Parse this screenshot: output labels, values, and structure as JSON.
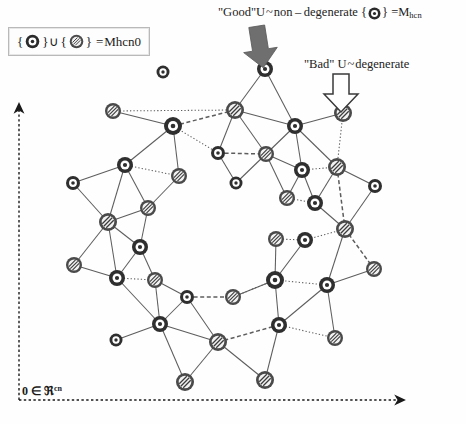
{
  "figure": {
    "title_good": {
      "prefix": "\"Good\"",
      "u": "U",
      "relation": "~",
      "kind": "non – degenerate",
      "set_open": "{",
      "set_close": "}",
      "equals": "=",
      "manifold": "M",
      "manifold_sub": "hcn"
    },
    "title_bad": {
      "prefix": "\"Bad\"",
      "u": "U",
      "relation": "~",
      "kind": "degenerate"
    },
    "legend": {
      "set_open": "{",
      "set_close": "}",
      "union": "∪",
      "equals": "=",
      "manifold": "M",
      "manifold_sub": "hcn",
      "manifold_sub2": "0"
    },
    "axis": {
      "origin": "0",
      "member": "∈",
      "space": "ℜ",
      "exponent": "cn"
    },
    "colors": {
      "node_good_ring": "#2f2f2f",
      "node_good_core": "#ffffff",
      "node_bad_ring": "#4a4a4a",
      "node_bad_fill": "#f2f2f2",
      "edge": "#5d5d5d",
      "arrow_solid": "#6f6f6f",
      "arrow_hollow_fill": "#ffffff",
      "arrow_hollow_stroke": "#3a3a3a",
      "axis": "#1a1a1a",
      "background": "#ffffff"
    },
    "node_types": {
      "good": "non-degenerate",
      "bad": "degenerate"
    },
    "arrows": {
      "solid_arrow": "solid-down-arrow-good",
      "hollow_arrow": "hollow-down-arrow-bad"
    },
    "axes": {
      "vertical": "dotted-vertical-axis-arrow",
      "horizontal": "dotted-horizontal-axis-arrow"
    }
  },
  "chart_data": {
    "type": "scatter",
    "nodes": [
      {
        "id": "iso1",
        "x": 163,
        "y": 72,
        "type": "good",
        "r": 6.5
      },
      {
        "id": "n1",
        "x": 265,
        "y": 69,
        "type": "good",
        "r": 8
      },
      {
        "id": "n2",
        "x": 113,
        "y": 111,
        "type": "bad",
        "r": 8
      },
      {
        "id": "n3",
        "x": 235,
        "y": 110,
        "type": "bad",
        "r": 9
      },
      {
        "id": "n4",
        "x": 343,
        "y": 113,
        "type": "bad",
        "r": 9
      },
      {
        "id": "n5",
        "x": 173,
        "y": 126,
        "type": "good",
        "r": 9
      },
      {
        "id": "n6",
        "x": 295,
        "y": 126,
        "type": "good",
        "r": 8
      },
      {
        "id": "n7",
        "x": 125,
        "y": 165,
        "type": "good",
        "r": 8
      },
      {
        "id": "n8",
        "x": 218,
        "y": 153,
        "type": "good",
        "r": 7
      },
      {
        "id": "n9",
        "x": 266,
        "y": 154,
        "type": "bad",
        "r": 8
      },
      {
        "id": "n10",
        "x": 179,
        "y": 176,
        "type": "bad",
        "r": 8
      },
      {
        "id": "n11",
        "x": 302,
        "y": 170,
        "type": "good",
        "r": 8
      },
      {
        "id": "n12",
        "x": 337,
        "y": 167,
        "type": "bad",
        "r": 9
      },
      {
        "id": "n13",
        "x": 73,
        "y": 183,
        "type": "good",
        "r": 7
      },
      {
        "id": "n14",
        "x": 236,
        "y": 183,
        "type": "good",
        "r": 6.5
      },
      {
        "id": "n15",
        "x": 375,
        "y": 186,
        "type": "good",
        "r": 7
      },
      {
        "id": "n16",
        "x": 148,
        "y": 208,
        "type": "bad",
        "r": 8
      },
      {
        "id": "n17",
        "x": 287,
        "y": 198,
        "type": "bad",
        "r": 8
      },
      {
        "id": "n18",
        "x": 315,
        "y": 203,
        "type": "good",
        "r": 8
      },
      {
        "id": "n19",
        "x": 108,
        "y": 222,
        "type": "bad",
        "r": 9
      },
      {
        "id": "n20",
        "x": 345,
        "y": 229,
        "type": "bad",
        "r": 9
      },
      {
        "id": "n21",
        "x": 140,
        "y": 247,
        "type": "good",
        "r": 8
      },
      {
        "id": "n22",
        "x": 276,
        "y": 239,
        "type": "bad",
        "r": 8
      },
      {
        "id": "n23",
        "x": 305,
        "y": 240,
        "type": "good",
        "r": 8
      },
      {
        "id": "n24",
        "x": 74,
        "y": 265,
        "type": "bad",
        "r": 8
      },
      {
        "id": "n25",
        "x": 117,
        "y": 278,
        "type": "good",
        "r": 8
      },
      {
        "id": "n26",
        "x": 155,
        "y": 280,
        "type": "bad",
        "r": 8
      },
      {
        "id": "n27",
        "x": 275,
        "y": 280,
        "type": "good",
        "r": 9
      },
      {
        "id": "n28",
        "x": 327,
        "y": 285,
        "type": "good",
        "r": 8
      },
      {
        "id": "n29",
        "x": 374,
        "y": 269,
        "type": "bad",
        "r": 8
      },
      {
        "id": "n30",
        "x": 187,
        "y": 297,
        "type": "good",
        "r": 7
      },
      {
        "id": "n31",
        "x": 233,
        "y": 297,
        "type": "bad",
        "r": 8
      },
      {
        "id": "n32",
        "x": 160,
        "y": 324,
        "type": "good",
        "r": 8
      },
      {
        "id": "n33",
        "x": 279,
        "y": 325,
        "type": "good",
        "r": 8
      },
      {
        "id": "n34",
        "x": 116,
        "y": 340,
        "type": "good",
        "r": 6.5
      },
      {
        "id": "n35",
        "x": 218,
        "y": 342,
        "type": "bad",
        "r": 9
      },
      {
        "id": "n36",
        "x": 335,
        "y": 338,
        "type": "bad",
        "r": 8
      },
      {
        "id": "n37",
        "x": 185,
        "y": 382,
        "type": "bad",
        "r": 9
      },
      {
        "id": "n38",
        "x": 265,
        "y": 380,
        "type": "bad",
        "r": 9
      }
    ],
    "edges": [
      {
        "a": "n1",
        "b": "n3",
        "style": "solid"
      },
      {
        "a": "n1",
        "b": "n6",
        "style": "solid"
      },
      {
        "a": "n2",
        "b": "n5",
        "style": "solid"
      },
      {
        "a": "n2",
        "b": "n3",
        "style": "dotted"
      },
      {
        "a": "n3",
        "b": "n5",
        "style": "dashed"
      },
      {
        "a": "n3",
        "b": "n6",
        "style": "solid"
      },
      {
        "a": "n3",
        "b": "n8",
        "style": "solid"
      },
      {
        "a": "n3",
        "b": "n9",
        "style": "solid"
      },
      {
        "a": "n5",
        "b": "n7",
        "style": "solid"
      },
      {
        "a": "n5",
        "b": "n10",
        "style": "solid"
      },
      {
        "a": "n5",
        "b": "n8",
        "style": "dotted"
      },
      {
        "a": "n6",
        "b": "n9",
        "style": "solid"
      },
      {
        "a": "n6",
        "b": "n4",
        "style": "solid"
      },
      {
        "a": "n6",
        "b": "n11",
        "style": "solid"
      },
      {
        "a": "n6",
        "b": "n12",
        "style": "solid"
      },
      {
        "a": "n4",
        "b": "n12",
        "style": "dotted"
      },
      {
        "a": "n7",
        "b": "n10",
        "style": "dotted"
      },
      {
        "a": "n7",
        "b": "n13",
        "style": "solid"
      },
      {
        "a": "n7",
        "b": "n16",
        "style": "solid"
      },
      {
        "a": "n7",
        "b": "n19",
        "style": "solid"
      },
      {
        "a": "n8",
        "b": "n9",
        "style": "dashed"
      },
      {
        "a": "n8",
        "b": "n14",
        "style": "solid"
      },
      {
        "a": "n9",
        "b": "n14",
        "style": "solid"
      },
      {
        "a": "n9",
        "b": "n17",
        "style": "solid"
      },
      {
        "a": "n9",
        "b": "n11",
        "style": "solid"
      },
      {
        "a": "n10",
        "b": "n16",
        "style": "solid"
      },
      {
        "a": "n11",
        "b": "n17",
        "style": "solid"
      },
      {
        "a": "n11",
        "b": "n18",
        "style": "solid"
      },
      {
        "a": "n11",
        "b": "n12",
        "style": "dotted"
      },
      {
        "a": "n12",
        "b": "n15",
        "style": "solid"
      },
      {
        "a": "n12",
        "b": "n18",
        "style": "solid"
      },
      {
        "a": "n12",
        "b": "n20",
        "style": "dashed"
      },
      {
        "a": "n13",
        "b": "n19",
        "style": "solid"
      },
      {
        "a": "n15",
        "b": "n20",
        "style": "solid"
      },
      {
        "a": "n16",
        "b": "n19",
        "style": "solid"
      },
      {
        "a": "n16",
        "b": "n21",
        "style": "solid"
      },
      {
        "a": "n17",
        "b": "n18",
        "style": "dotted"
      },
      {
        "a": "n18",
        "b": "n20",
        "style": "solid"
      },
      {
        "a": "n19",
        "b": "n21",
        "style": "solid"
      },
      {
        "a": "n19",
        "b": "n24",
        "style": "solid"
      },
      {
        "a": "n19",
        "b": "n25",
        "style": "solid"
      },
      {
        "a": "n20",
        "b": "n23",
        "style": "dotted"
      },
      {
        "a": "n20",
        "b": "n29",
        "style": "dashed"
      },
      {
        "a": "n20",
        "b": "n28",
        "style": "solid"
      },
      {
        "a": "n21",
        "b": "n25",
        "style": "solid"
      },
      {
        "a": "n21",
        "b": "n26",
        "style": "solid"
      },
      {
        "a": "n22",
        "b": "n23",
        "style": "dotted"
      },
      {
        "a": "n22",
        "b": "n27",
        "style": "solid"
      },
      {
        "a": "n23",
        "b": "n27",
        "style": "solid"
      },
      {
        "a": "n24",
        "b": "n25",
        "style": "solid"
      },
      {
        "a": "n25",
        "b": "n26",
        "style": "dotted"
      },
      {
        "a": "n25",
        "b": "n32",
        "style": "solid"
      },
      {
        "a": "n26",
        "b": "n30",
        "style": "solid"
      },
      {
        "a": "n26",
        "b": "n32",
        "style": "solid"
      },
      {
        "a": "n27",
        "b": "n31",
        "style": "solid"
      },
      {
        "a": "n27",
        "b": "n33",
        "style": "solid"
      },
      {
        "a": "n27",
        "b": "n28",
        "style": "dotted"
      },
      {
        "a": "n28",
        "b": "n29",
        "style": "solid"
      },
      {
        "a": "n28",
        "b": "n33",
        "style": "solid"
      },
      {
        "a": "n28",
        "b": "n36",
        "style": "solid"
      },
      {
        "a": "n30",
        "b": "n31",
        "style": "dashed"
      },
      {
        "a": "n30",
        "b": "n32",
        "style": "solid"
      },
      {
        "a": "n30",
        "b": "n35",
        "style": "solid"
      },
      {
        "a": "n31",
        "b": "n27",
        "style": "dotted"
      },
      {
        "a": "n32",
        "b": "n34",
        "style": "solid"
      },
      {
        "a": "n32",
        "b": "n35",
        "style": "solid"
      },
      {
        "a": "n32",
        "b": "n37",
        "style": "solid"
      },
      {
        "a": "n33",
        "b": "n35",
        "style": "dashed"
      },
      {
        "a": "n33",
        "b": "n36",
        "style": "dotted"
      },
      {
        "a": "n33",
        "b": "n38",
        "style": "solid"
      },
      {
        "a": "n35",
        "b": "n37",
        "style": "solid"
      },
      {
        "a": "n35",
        "b": "n38",
        "style": "solid"
      }
    ],
    "xlabel": "0 ∈ ℜ^cn",
    "ylabel": "",
    "legend_position": "top-left",
    "grid": false
  }
}
